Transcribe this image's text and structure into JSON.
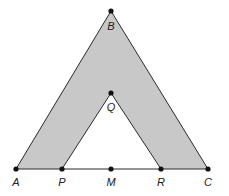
{
  "diagram": {
    "type": "geometry-figure",
    "colors": {
      "shade": "#c8c8c8",
      "line": "#2a2a2a",
      "point": "#111111",
      "background": "#ffffff"
    },
    "points": [
      {
        "id": "A",
        "label": "A",
        "x": 16,
        "y": 169,
        "lx": 16,
        "ly": 186
      },
      {
        "id": "P",
        "label": "P",
        "x": 62,
        "y": 169,
        "lx": 62,
        "ly": 186
      },
      {
        "id": "M",
        "label": "M",
        "x": 111,
        "y": 169,
        "lx": 111,
        "ly": 186
      },
      {
        "id": "R",
        "label": "R",
        "x": 161,
        "y": 169,
        "lx": 161,
        "ly": 186
      },
      {
        "id": "C",
        "label": "C",
        "x": 208,
        "y": 169,
        "lx": 208,
        "ly": 186
      },
      {
        "id": "B",
        "label": "B",
        "x": 111,
        "y": 11,
        "lx": 111,
        "ly": 30
      },
      {
        "id": "Q",
        "label": "Q",
        "x": 111,
        "y": 93,
        "lx": 111,
        "ly": 111
      }
    ],
    "segments": [
      [
        "A",
        "B"
      ],
      [
        "B",
        "C"
      ],
      [
        "A",
        "C"
      ],
      [
        "P",
        "Q"
      ],
      [
        "Q",
        "R"
      ]
    ],
    "shaded_region": [
      "A",
      "B",
      "C",
      "R",
      "Q",
      "P"
    ]
  }
}
